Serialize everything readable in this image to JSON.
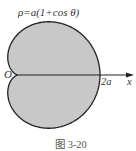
{
  "figure": {
    "equation_label": "ρ=a(1+cos θ)",
    "origin_label": "O",
    "tick_label": "2a",
    "axis_label": "x",
    "caption": "图 3-20",
    "curve": {
      "type": "cardioid",
      "equation": "ρ=a(1+cos θ)",
      "fill_color": "#c8c8c8",
      "stroke_color": "#222222"
    }
  }
}
